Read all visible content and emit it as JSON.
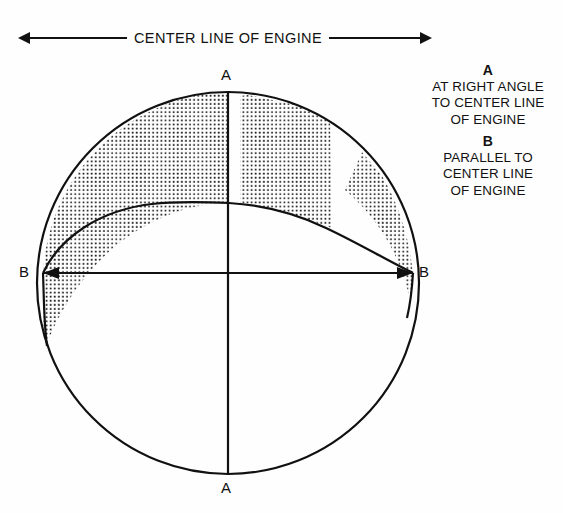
{
  "header": {
    "caption": "CENTER LINE OF ENGINE",
    "left_arrow_icon": "arrow-left",
    "right_arrow_icon": "arrow-right"
  },
  "legend": {
    "entries": [
      {
        "key": "A",
        "lines": [
          "AT RIGHT ANGLE",
          "TO CENTER LINE",
          "OF ENGINE"
        ]
      },
      {
        "key": "B",
        "lines": [
          "PARALLEL TO",
          "CENTER LINE",
          "OF ENGINE"
        ]
      }
    ]
  },
  "diagram": {
    "labels": {
      "a_top": "A",
      "a_bottom": "A",
      "b_left": "B",
      "b_right": "B"
    },
    "colors": {
      "stroke": "#111111",
      "background": "#ffffff",
      "stipple": "#1a1a1a"
    },
    "geometry": {
      "center_x": 228,
      "center_y": 283,
      "radius": 191,
      "inner_arc_apex_x": 229,
      "inner_arc_apex_y": 203,
      "b_axis_y": 273,
      "b_axis_left_x": 43,
      "b_axis_right_x": 413,
      "a_axis_x": 228,
      "a_axis_top_y": 92,
      "a_axis_bottom_y": 474
    },
    "shaded_regions": [
      {
        "name": "left-crescent",
        "side": "left",
        "pattern": "stipple"
      },
      {
        "name": "right-inner-band",
        "side": "right",
        "pattern": "stipple"
      },
      {
        "name": "right-outer-sliver",
        "side": "right",
        "pattern": "stipple"
      }
    ]
  }
}
